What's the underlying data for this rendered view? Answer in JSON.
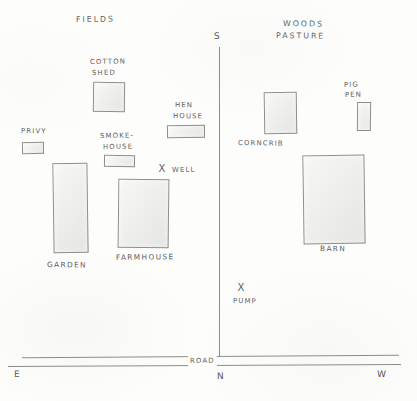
{
  "map": {
    "title": "Farmstead Plan",
    "area_labels": [
      {
        "name": "fields",
        "text": "FIELDS",
        "x": 76,
        "y": 14
      },
      {
        "name": "woods-pasture-line1",
        "text": "WOODS",
        "x": 283,
        "y": 18
      },
      {
        "name": "woods-pasture-line2",
        "text": "PASTURE",
        "x": 276,
        "y": 30
      }
    ],
    "buildings": [
      {
        "name": "cotton-shed",
        "label_lines": [
          "COTTON",
          "SHED"
        ],
        "label_x": 90,
        "label_y": 57,
        "x": 93,
        "y": 82,
        "w": 32,
        "h": 30
      },
      {
        "name": "privy",
        "label_lines": [
          "PRIVY"
        ],
        "label_x": 21,
        "label_y": 126,
        "x": 22,
        "y": 142,
        "w": 22,
        "h": 12
      },
      {
        "name": "smokehouse",
        "label_lines": [
          "SMOKE-",
          "HOUSE"
        ],
        "label_x": 100,
        "label_y": 131,
        "x": 104,
        "y": 155,
        "w": 31,
        "h": 12
      },
      {
        "name": "hen-house",
        "label_lines": [
          "HEN",
          "HOUSE"
        ],
        "label_x": 175,
        "label_y": 100,
        "x": 167,
        "y": 125,
        "w": 38,
        "h": 13
      },
      {
        "name": "garden",
        "label_lines": [
          "GARDEN"
        ],
        "label_x": 47,
        "label_y": 259,
        "x": 53,
        "y": 163,
        "w": 35,
        "h": 90
      },
      {
        "name": "farmhouse",
        "label_lines": [
          "FARMHOUSE"
        ],
        "label_x": 116,
        "label_y": 252,
        "x": 118,
        "y": 179,
        "w": 51,
        "h": 69
      },
      {
        "name": "corncrib",
        "label_lines": [
          "CORNCRIB"
        ],
        "label_x": 238,
        "label_y": 138,
        "x": 264,
        "y": 92,
        "w": 33,
        "h": 42
      },
      {
        "name": "pig-pen",
        "label_lines": [
          "PIG",
          "PEN"
        ],
        "label_x": 344,
        "label_y": 80,
        "x": 357,
        "y": 102,
        "w": 14,
        "h": 29
      },
      {
        "name": "barn",
        "label_lines": [
          "BARN"
        ],
        "label_x": 320,
        "label_y": 243,
        "x": 303,
        "y": 155,
        "w": 62,
        "h": 89
      }
    ],
    "point_markers": [
      {
        "name": "well",
        "text": "WELL",
        "mark": "X",
        "mark_x": 157,
        "mark_y": 164,
        "label_x": 172,
        "label_y": 165
      },
      {
        "name": "pump",
        "text": "PUMP",
        "mark": "X",
        "mark_x": 236,
        "mark_y": 283,
        "label_x": 233,
        "label_y": 296
      }
    ],
    "road": {
      "label": "ROAD",
      "label_x": 188,
      "label_y": 357,
      "upper_line_y": 356,
      "lower_line_y": 365
    },
    "lane": {
      "name": "driveway",
      "x": 219,
      "top_y": 47,
      "bottom_y": 357
    },
    "compass": [
      {
        "name": "compass-s",
        "text": "S",
        "x": 214,
        "y": 31
      },
      {
        "name": "compass-e",
        "text": "E",
        "x": 14,
        "y": 369
      },
      {
        "name": "compass-n",
        "text": "N",
        "x": 217,
        "y": 371
      },
      {
        "name": "compass-w",
        "text": "W",
        "x": 377,
        "y": 369
      }
    ],
    "colors": {
      "ink": "#5d5d5c",
      "line": "#8c8c8a",
      "building_fill": "#ededeb",
      "building_stroke": "#8e8e8c",
      "paper": "#fdfdfc"
    }
  }
}
